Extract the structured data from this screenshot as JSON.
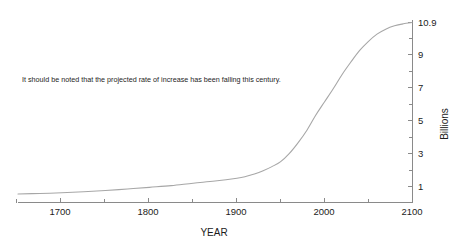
{
  "chart_data": {
    "type": "line",
    "title": "",
    "xlabel": "YEAR",
    "ylabel": "Billions",
    "xlim": [
      1650,
      2100
    ],
    "ylim": [
      0,
      10.9
    ],
    "grid": false,
    "legend": null,
    "x_ticks": [
      1700,
      1800,
      1900,
      2000,
      2100
    ],
    "x_tick_labels": [
      "1700",
      "1800",
      "1900",
      "2000",
      "2100"
    ],
    "x_minor_ticks": [
      1650,
      1750,
      1850,
      1950,
      2050
    ],
    "y_ticks": [
      1,
      3,
      5,
      7,
      9,
      10.9
    ],
    "y_tick_labels": [
      "1",
      "3",
      "5",
      "7",
      "9",
      "10.9"
    ],
    "y_minor_ticks": [
      2,
      4,
      6,
      8,
      10
    ],
    "axis_position": {
      "y_axis": "right",
      "x_axis": "bottom"
    },
    "annotations": [
      {
        "text": "It should be noted that the projected rate of increase has been falling this century.",
        "x": 1665,
        "y": 6.3
      }
    ],
    "series": [
      {
        "name": "World population",
        "color": "#a7a7a7",
        "x": [
          1650,
          1675,
          1700,
          1725,
          1750,
          1775,
          1800,
          1825,
          1850,
          1875,
          1900,
          1910,
          1920,
          1930,
          1940,
          1950,
          1960,
          1970,
          1980,
          1990,
          2000,
          2010,
          2020,
          2030,
          2040,
          2050,
          2060,
          2070,
          2080,
          2090,
          2100
        ],
        "values": [
          0.55,
          0.58,
          0.62,
          0.68,
          0.76,
          0.85,
          0.95,
          1.05,
          1.2,
          1.33,
          1.5,
          1.6,
          1.75,
          1.95,
          2.2,
          2.5,
          3.0,
          3.65,
          4.4,
          5.3,
          6.1,
          6.9,
          7.75,
          8.5,
          9.2,
          9.75,
          10.2,
          10.5,
          10.7,
          10.82,
          10.9
        ],
        "units": "billions"
      }
    ]
  },
  "axis_titles": {
    "x": "YEAR",
    "y": "Billions"
  },
  "annotation": {
    "note": "It should be noted that the projected rate of increase has been falling this century."
  },
  "colors": {
    "curve": "#a7a7a7",
    "axis": "#8a8a8a",
    "text": "#1c1c1c",
    "background": "#ffffff"
  }
}
